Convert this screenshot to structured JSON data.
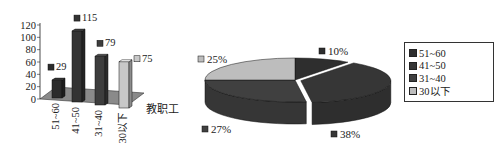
{
  "chart_data": [
    {
      "type": "bar",
      "title": "",
      "xlabel": "教职工",
      "ylabel": "",
      "ylim": [
        0,
        120
      ],
      "yticks": [
        0,
        20,
        40,
        60,
        80,
        100,
        120
      ],
      "categories": [
        "51~60",
        "41~50",
        "31~40",
        "30以下"
      ],
      "values": [
        29,
        115,
        79,
        75
      ],
      "data_labels": [
        "29",
        "115",
        "79",
        "75"
      ],
      "colors": [
        "#2b2b2b",
        "#333333",
        "#3d3d3d",
        "#c8c8c8"
      ],
      "floor_color": "#8a8a8a",
      "grid": false,
      "style": "3d"
    },
    {
      "type": "pie",
      "title": "",
      "categories": [
        "51~60",
        "41~50",
        "31~40",
        "30以下"
      ],
      "values": [
        10,
        38,
        27,
        25
      ],
      "data_labels": [
        "10%",
        "38%",
        "27%",
        "25%"
      ],
      "colors": [
        "#2e2e2e",
        "#363636",
        "#404040",
        "#bdbdbd"
      ],
      "style": "3d-exploded",
      "legend": {
        "placement": "right",
        "entries": [
          "51~60",
          "41~50",
          "31~40",
          "30以下"
        ]
      }
    }
  ]
}
